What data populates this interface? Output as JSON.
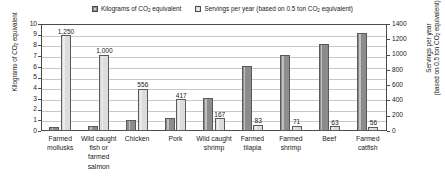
{
  "chart_data": {
    "type": "bar",
    "title": "",
    "categories": [
      "Farmed mollusks",
      "Wild caught fish or farmed salmon",
      "Chicken",
      "Pork",
      "Wild caught shrimp",
      "Farmed tilapia",
      "Farmed shrimp",
      "Beef",
      "Farmed catfish"
    ],
    "series": [
      {
        "name": "Kilograms of CO2 equivalent",
        "axis": "left",
        "color": "#8c8c8c",
        "values": [
          0.4,
          0.5,
          1.0,
          1.25,
          3.1,
          6.1,
          7.1,
          8.1,
          9.15
        ],
        "labels": [
          "",
          "",
          "",
          "",
          "",
          "",
          "",
          "",
          ""
        ]
      },
      {
        "name": "Servings per year (based on 0.5 ton CO2 equivalent)",
        "axis": "right",
        "color": "#dcdcdc",
        "values": [
          1250,
          1000,
          556,
          417,
          167,
          83,
          71,
          63,
          56
        ],
        "labels": [
          "1,250",
          "1,000",
          "556",
          "417",
          "167",
          "83",
          "71",
          "63",
          "56"
        ]
      }
    ],
    "xlabel": "",
    "ylabel": "Kilograms of CO2 equivalent",
    "y2label": "Servings per year (based on 0.5 ton CO2 equivalent)",
    "ylim": [
      0,
      10
    ],
    "y2lim": [
      0,
      1400
    ],
    "yticks": [
      0,
      1,
      2,
      3,
      4,
      5,
      6,
      7,
      8,
      9,
      10
    ],
    "y2ticks": [
      0,
      200,
      400,
      600,
      800,
      1000,
      1200,
      1400
    ],
    "grid": true,
    "legend_position": "top-center"
  },
  "legend": {
    "entries": [
      {
        "prefix": "Kilograms of CO",
        "sub": "2",
        "suffix": " equivalent"
      },
      {
        "prefix": "Servings per year (based on 0.5 ton CO",
        "sub": "2",
        "suffix": " equivalent)"
      }
    ]
  },
  "axes": {
    "left": {
      "title_prefix": "Kilograms of CO",
      "title_sub": "2",
      "title_suffix": " equivalent",
      "ticks": [
        "10",
        "9",
        "8",
        "7",
        "6",
        "5",
        "4",
        "3",
        "2",
        "1",
        "0"
      ]
    },
    "right": {
      "title_line1": "Servings per year",
      "title_line2_prefix": "(based on 0.5 ton CO",
      "title_line2_sub": "2",
      "title_line2_suffix": " equivalent)",
      "ticks": [
        "1400",
        "1200",
        "1000",
        "800",
        "600",
        "400",
        "200",
        "0"
      ]
    }
  }
}
